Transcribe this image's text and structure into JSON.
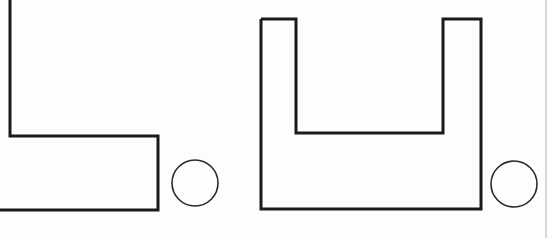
{
  "document": {
    "title": "Geometric Shapes Figure",
    "background_color": "#fdfdfd",
    "stroke_color": "#1a1a1a",
    "page_edge_color": "#b9b9b9",
    "width": 552,
    "height": 238
  },
  "figure": {
    "caption": "",
    "shapes": [
      {
        "id": "left-l-shape",
        "name": "L-shaped polygon",
        "type": "polyline",
        "clipped": "left and top edges run off the image boundary",
        "stroke_width": 3,
        "points": "10,-4 10,136 158,136 158,210 -4,210",
        "vertices": [
          {
            "x": 10,
            "y": -4
          },
          {
            "x": 10,
            "y": 136
          },
          {
            "x": 158,
            "y": 136
          },
          {
            "x": 158,
            "y": 210
          },
          {
            "x": -4,
            "y": 210
          }
        ]
      },
      {
        "id": "right-u-shape",
        "name": "U-shaped polygon",
        "type": "polyline",
        "clipped": "top edges of both prongs are open at the top",
        "stroke_width": 3,
        "points": "261,19 261,209 481,209 481,19 443,19 443,133 296,133 296,19 261,19",
        "vertices": [
          {
            "x": 261,
            "y": 19
          },
          {
            "x": 261,
            "y": 209
          },
          {
            "x": 481,
            "y": 209
          },
          {
            "x": 481,
            "y": 19
          },
          {
            "x": 443,
            "y": 19
          },
          {
            "x": 443,
            "y": 133
          },
          {
            "x": 296,
            "y": 133
          },
          {
            "x": 296,
            "y": 19
          }
        ]
      }
    ],
    "circles": [
      {
        "id": "left-circle",
        "name": "small circle beside L-shape",
        "cx": 195,
        "cy": 183,
        "r": 23,
        "stroke_width": 1.6
      },
      {
        "id": "right-circle",
        "name": "small circle beside U-shape",
        "cx": 514,
        "cy": 184,
        "r": 23,
        "stroke_width": 1.6
      }
    ],
    "page_edge": {
      "id": "page-edge",
      "name": "faint vertical scan edge at right side",
      "x": 546,
      "y1": 0,
      "y2": 238
    }
  }
}
